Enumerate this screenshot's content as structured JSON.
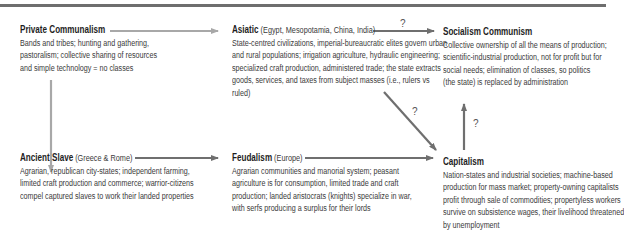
{
  "diagram": {
    "nodes": {
      "private_communalism": {
        "title": "Private Communalism",
        "subtitle": "",
        "lines": [
          "Bands and tribes; hunting and gathering,",
          "pastoralism; collective sharing of resources",
          "and simple technology = no classes"
        ]
      },
      "asiatic": {
        "title": "Asiatic",
        "subtitle": "(Egypt, Mesopotamia, China, India)",
        "lines": [
          "State-centred civilizations, imperial-bureaucratic elites govern urban",
          "and rural populations; irrigation agriculture, hydraulic engineering;",
          "specialized craft production, administered trade; the state extracts",
          "goods, services, and taxes from subject masses (i.e., rulers vs",
          "ruled)"
        ]
      },
      "socialism_communism": {
        "title": "Socialism Communism",
        "subtitle": "",
        "lines": [
          "Collective ownership of all the means of production;",
          "scientific-industrial production, not for profit but for",
          "social needs; elimination of classes, so politics",
          "(the state) is replaced by administration"
        ]
      },
      "ancient_slave": {
        "title": "Ancient Slave",
        "subtitle": "(Greece & Rome)",
        "lines": [
          "Agrarian, republican city-states; independent farming,",
          "limited craft production and commerce; warrior-citizens",
          "compel captured slaves to work their landed properties"
        ]
      },
      "feudalism": {
        "title": "Feudalism",
        "subtitle": "(Europe)",
        "lines": [
          "Agrarian communities and manorial system; peasant",
          "agriculture is for consumption, limited trade and craft",
          "production; landed aristocrats (knights) specialize in war,",
          "with serfs producing a surplus for their lords"
        ]
      },
      "capitalism": {
        "title": "Capitalism",
        "subtitle": "",
        "lines": [
          "Nation-states and industrial societies; machine-based",
          "production for mass market; property-owning capitalists",
          "profit through sale of commodities; propertyless workers",
          "survive on subsistence wages, their livelihood threatened",
          "by unemployment"
        ]
      }
    },
    "edges": [
      {
        "from": "Private Communalism",
        "to": "Asiatic",
        "label": ""
      },
      {
        "from": "Private Communalism",
        "to": "Ancient Slave",
        "label": ""
      },
      {
        "from": "Asiatic",
        "to": "Socialism Communism",
        "label": "?"
      },
      {
        "from": "Asiatic",
        "to": "Capitalism",
        "label": "?"
      },
      {
        "from": "Ancient Slave",
        "to": "Feudalism",
        "label": ""
      },
      {
        "from": "Feudalism",
        "to": "Capitalism",
        "label": ""
      },
      {
        "from": "Capitalism",
        "to": "Socialism Communism",
        "label": "?"
      }
    ],
    "question_mark": "?",
    "colors": {
      "arrow_dark": "#6f6f6f",
      "arrow_light": "#a8a8a8",
      "rule": "#6e6e6e",
      "text": "#2a2a2a"
    }
  }
}
